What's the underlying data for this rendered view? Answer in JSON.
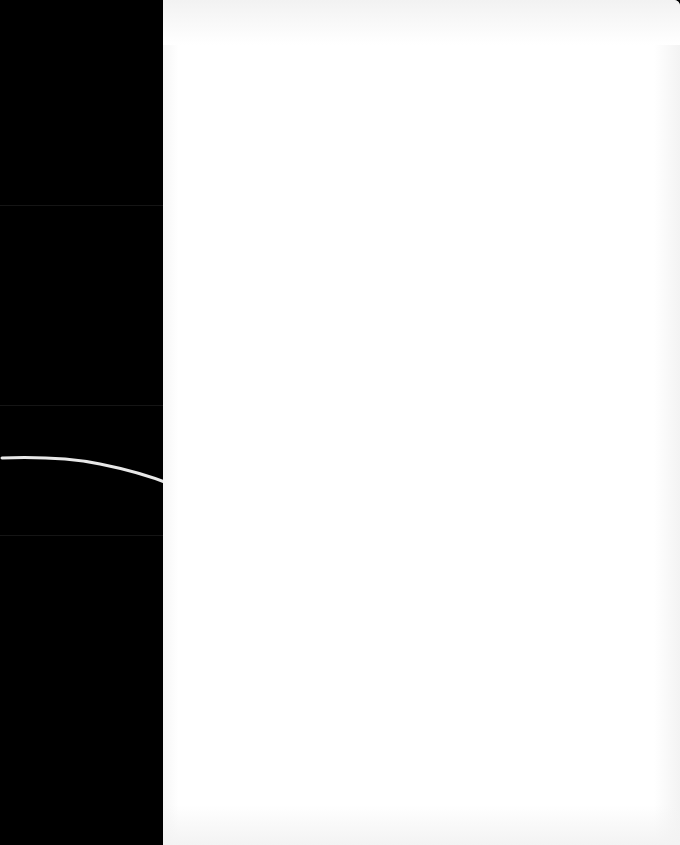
{
  "scene": {
    "description": "Blank white sheet against a black background with a thin curved white line",
    "colors": {
      "background": "#000000",
      "sheet": "#ffffff",
      "curve": "#e8e8e8"
    }
  }
}
